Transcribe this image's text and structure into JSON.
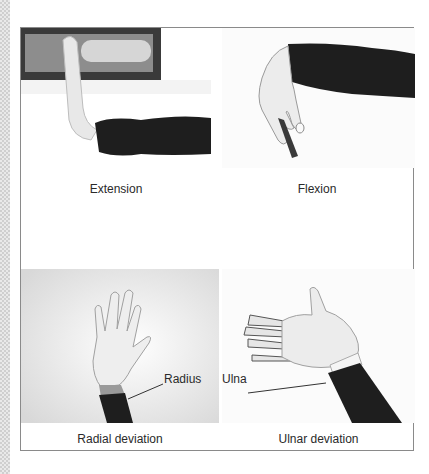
{
  "figure": {
    "panels": [
      {
        "id": "extension",
        "caption": "Extension"
      },
      {
        "id": "flexion",
        "caption": "Flexion"
      },
      {
        "id": "radial-deviation",
        "caption": "Radial deviation",
        "annotation": "Radius"
      },
      {
        "id": "ulnar-deviation",
        "caption": "Ulnar deviation",
        "annotation": "Ulna"
      }
    ]
  },
  "colors": {
    "sleeve": "#1e1e1e",
    "skin": "#f2f2f2",
    "border": "#8a8a8a",
    "caption_text": "#2a2a2a"
  }
}
